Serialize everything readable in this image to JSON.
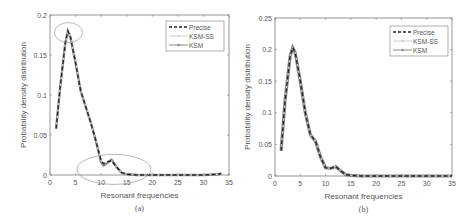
{
  "chart_data": [
    {
      "type": "line",
      "panel_label": "(a)",
      "xlabel": "Resonant frequencies",
      "ylabel": "Probability density distribution",
      "xlim": [
        0,
        35
      ],
      "ylim": [
        0,
        0.2
      ],
      "xticks": [
        "0",
        "5",
        "10",
        "15",
        "20",
        "25",
        "30",
        "35"
      ],
      "yticks": [
        "0",
        "0.05",
        "0.1",
        "0.15",
        "0.2"
      ],
      "grid": false,
      "legend_position": "upper right",
      "legend": [
        "Precise",
        "KSM-SS",
        "KSM"
      ],
      "annotations": [
        "ellipse around peak (~3.5, 0.18)",
        "ellipse around region x 6–20 near y 0–0.02"
      ],
      "x": [
        1.2,
        2,
        3,
        3.5,
        4,
        5,
        6,
        7,
        8,
        9,
        10,
        10.5,
        11,
        12,
        12.5,
        13,
        14,
        15,
        17,
        20,
        25,
        30,
        33,
        33.5
      ],
      "series": [
        {
          "name": "Precise",
          "style": "dashed",
          "values": [
            0.058,
            0.11,
            0.165,
            0.18,
            0.172,
            0.14,
            0.105,
            0.085,
            0.065,
            0.042,
            0.018,
            0.014,
            0.016,
            0.018,
            0.014,
            0.01,
            0.003,
            0.001,
            0,
            0,
            0,
            0,
            0.001,
            0.002
          ]
        },
        {
          "name": "KSM-SS",
          "style": "solid-light",
          "values": [
            0.058,
            0.11,
            0.165,
            0.18,
            0.172,
            0.14,
            0.105,
            0.085,
            0.065,
            0.042,
            0.018,
            0.014,
            0.016,
            0.018,
            0.014,
            0.01,
            0.003,
            0.001,
            0,
            0,
            0,
            0,
            0.001,
            0.002
          ]
        },
        {
          "name": "KSM",
          "style": "solid-marker",
          "values": [
            0.058,
            0.11,
            0.165,
            0.18,
            0.172,
            0.14,
            0.105,
            0.085,
            0.065,
            0.042,
            0.016,
            0.012,
            0.014,
            0.019,
            0.015,
            0.01,
            0.003,
            0.001,
            0,
            0,
            0,
            0,
            0.001,
            0.002
          ]
        }
      ]
    },
    {
      "type": "line",
      "panel_label": "(b)",
      "xlabel": "Resonant frequencies",
      "ylabel": "Probability density distribution",
      "xlim": [
        0,
        35
      ],
      "ylim": [
        0,
        0.25
      ],
      "xticks": [
        "0",
        "5",
        "10",
        "15",
        "20",
        "25",
        "30",
        "35"
      ],
      "yticks": [
        "0",
        "0.05",
        "0.1",
        "0.15",
        "0.2",
        "0.25"
      ],
      "grid": false,
      "legend_position": "upper right",
      "legend": [
        "Precise",
        "KSM-SS",
        "KSM"
      ],
      "x": [
        1.2,
        2,
        3,
        3.5,
        4,
        5,
        6,
        7,
        8,
        9,
        10,
        11,
        12,
        13,
        14,
        15,
        17,
        20,
        25,
        30,
        35
      ],
      "series": [
        {
          "name": "Precise",
          "style": "dashed",
          "values": [
            0.04,
            0.12,
            0.19,
            0.203,
            0.195,
            0.15,
            0.1,
            0.065,
            0.055,
            0.03,
            0.013,
            0.012,
            0.015,
            0.008,
            0.002,
            0.001,
            0,
            0,
            0,
            0,
            0
          ]
        },
        {
          "name": "KSM-SS",
          "style": "solid-light",
          "values": [
            0.04,
            0.12,
            0.19,
            0.203,
            0.195,
            0.15,
            0.1,
            0.065,
            0.055,
            0.03,
            0.013,
            0.012,
            0.015,
            0.008,
            0.002,
            0.001,
            0,
            0,
            0,
            0,
            0
          ]
        },
        {
          "name": "KSM",
          "style": "solid-marker",
          "values": [
            0.04,
            0.12,
            0.19,
            0.203,
            0.195,
            0.15,
            0.1,
            0.065,
            0.055,
            0.03,
            0.013,
            0.012,
            0.015,
            0.008,
            0.002,
            0.001,
            0,
            0,
            0,
            0,
            0
          ]
        }
      ]
    }
  ],
  "labels": {
    "a": {
      "caption": "(a)",
      "xlabel": "Resonant frequencies",
      "ylabel": "Probability density distribution",
      "legend": [
        "Precise",
        "KSM-SS",
        "KSM"
      ]
    },
    "b": {
      "caption": "(b)",
      "xlabel": "Resonant frequencies",
      "ylabel": "Probability density distribution",
      "legend": [
        "Precise",
        "KSM-SS",
        "KSM"
      ]
    }
  },
  "colors": {
    "axis": "#7a7a7a",
    "precise": "#222222",
    "ksm_ss": "#cfcfcf",
    "ksm": "#8a8a8a",
    "annotation": "#9a9a9a",
    "text": "#555555"
  }
}
